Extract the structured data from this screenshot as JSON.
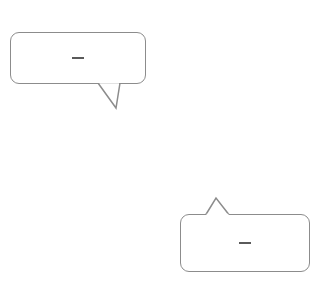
{
  "chart_data": {
    "type": "line",
    "title": "",
    "xlabel": "x",
    "ylabel": "y",
    "xlim": [
      -4,
      4
    ],
    "ylim": [
      -3,
      5.2
    ],
    "grid": true,
    "x_ticks": [
      "-3",
      "-2",
      "-1",
      "2",
      "3"
    ],
    "y_ticks": [
      "4",
      "2",
      "1",
      "-2"
    ],
    "series": [
      {
        "name": "y = 1/2 x + 3",
        "slope": 0.5,
        "intercept": 3,
        "color": "#808080",
        "x": [
          -4,
          4
        ],
        "y": [
          1,
          5
        ]
      },
      {
        "name": "y = 1/2 x - 1",
        "slope": 0.5,
        "intercept": -1,
        "color": "#4a4a4a",
        "x": [
          -4,
          4
        ],
        "y": [
          -3,
          1
        ]
      }
    ],
    "annotations": [
      {
        "text": "y = 1/2 x + 3",
        "type": "callout",
        "points_to": "upper line"
      },
      {
        "text": "y = 1/2 x - 1",
        "type": "callout",
        "points_to": "lower line"
      }
    ]
  },
  "labels": {
    "x_axis": "x",
    "y_axis": "y",
    "x_ticks": [
      {
        "text": "−3",
        "value": -3
      },
      {
        "text": "−2",
        "value": -2
      },
      {
        "text": "−1",
        "value": -1
      },
      {
        "text": "2",
        "value": 2
      },
      {
        "text": "3",
        "value": 3
      }
    ],
    "y_ticks": [
      {
        "text": "4",
        "value": 4
      },
      {
        "text": "2",
        "value": 2
      },
      {
        "text": "1",
        "value": 1
      },
      {
        "text": "−2",
        "value": -2
      }
    ]
  },
  "callouts": {
    "upper": {
      "lhs": "y",
      "eq": "=",
      "num": "1",
      "den": "2",
      "var": "x",
      "op": "+",
      "const": "3"
    },
    "lower": {
      "lhs": "y",
      "eq": "=",
      "num": "1",
      "den": "2",
      "var": "x",
      "op": "−",
      "const": "1"
    }
  },
  "colors": {
    "grid": "#c8c8c8",
    "axis": "#111111",
    "line_upper": "#808080",
    "line_lower": "#4a4a4a",
    "bubble_border": "#8c8c8c"
  }
}
